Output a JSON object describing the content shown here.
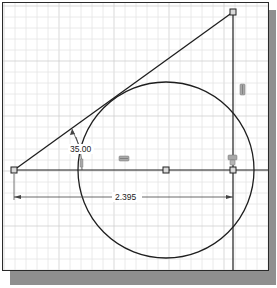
{
  "sketch": {
    "title": "2D sketch with tangent circle",
    "grid": {
      "spacing": 11,
      "major_every": 5,
      "minor_color": "#e4e4e4",
      "major_color": "#cfcfcf"
    },
    "colors": {
      "geometry": "#1e1e1e",
      "dimension": "#333333",
      "constraint": "#9a9a9a",
      "frame": "#2a2a2a",
      "shadow": "#8f8f8f"
    },
    "points": [
      {
        "name": "left-endpoint",
        "x": 14,
        "y": 170
      },
      {
        "name": "circle-center",
        "x": 166,
        "y": 170
      },
      {
        "name": "corner-point",
        "x": 233,
        "y": 170
      },
      {
        "name": "top-endpoint",
        "x": 233,
        "y": 12
      }
    ],
    "circle": {
      "cx": 166,
      "cy": 170,
      "r": 88
    },
    "dimensions": {
      "angle": {
        "value": "35.00",
        "label_x": 70,
        "label_y": 152
      },
      "linear": {
        "value": "2.395",
        "label_x": 115,
        "label_y": 200
      }
    },
    "constraints": {
      "horizontal": "horizontal-constraint",
      "vertical": "vertical-constraint",
      "coincident": "coincident-constraint",
      "tangent": "tangent-constraint"
    }
  }
}
